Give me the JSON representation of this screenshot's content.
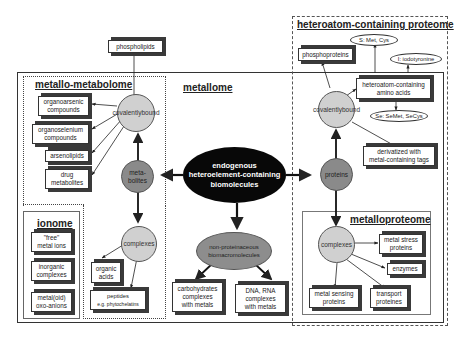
{
  "sections": {
    "metallome": "metallome",
    "metallo_metabolome": "metallo-metabolome",
    "heteroatom_proteome": "heteroatom-containing proteome",
    "ionome": "ionome",
    "metalloproteome": "metalloproteome"
  },
  "center": {
    "line1": "endogenous",
    "line2": "heteroelement-containing",
    "line3": "biomolecules"
  },
  "metabolites": {
    "node": {
      "line1": "meta-",
      "line2": "bolites"
    },
    "covalently_bound": {
      "line1": "covalently",
      "line2": "bound"
    },
    "complexes": "complexes",
    "phospholipids": "phospholipids",
    "covalent_products": [
      {
        "line1": "organoarsenic",
        "line2": "compounds"
      },
      {
        "line1": "organoselenium",
        "line2": "compounds"
      },
      {
        "line1": "arsenolipids",
        "line2": ""
      },
      {
        "line1": "drug",
        "line2": "metabolites"
      }
    ],
    "complex_products": [
      {
        "line1": "organic",
        "line2": "acids"
      },
      {
        "line1": "peptides",
        "line2": "e.g. phytochelatins"
      }
    ]
  },
  "ionome": {
    "items": [
      {
        "line1": "\"free\"",
        "line2": "metal ions"
      },
      {
        "line1": "inorganic",
        "line2": "complexes"
      },
      {
        "line1": "metal(oid)",
        "line2": "oxo-anions"
      }
    ]
  },
  "nonproteinaceous": {
    "node": {
      "line1": "non-proteinaceous",
      "line2": "biomacromolecules"
    },
    "products": [
      {
        "line1": "carbohydrates",
        "line2": "complexes",
        "line3": "with metals"
      },
      {
        "line1": "DNA, RNA",
        "line2": "complexes",
        "line3": "with metals"
      }
    ]
  },
  "proteins": {
    "node": "proteins",
    "covalently_bound": {
      "line1": "covalently",
      "line2": "bound"
    },
    "phosphoproteins": "phosphoproteins",
    "amino_acids": {
      "line1": "heteroatom-containing",
      "line2": "amino acids"
    },
    "ovals": {
      "s": "S: Met, Cys",
      "i": "I: iodotyronine",
      "se": "Se: SeMet, SeCys"
    },
    "derivatized": {
      "line1": "derivatized with",
      "line2": "metal-containing tags"
    },
    "complexes": "complexes",
    "metalloproteome_items": [
      {
        "line1": "metal stress",
        "line2": "proteins"
      },
      {
        "line1": "enzymes",
        "line2": ""
      },
      {
        "line1": "metal sensing",
        "line2": "proteins"
      },
      {
        "line1": "transport",
        "line2": "proteines"
      }
    ]
  },
  "colors": {
    "center_fill": "#080808",
    "dark_node": "#8a8a8a",
    "light_node": "#d0d0d0",
    "border": "#333333"
  }
}
